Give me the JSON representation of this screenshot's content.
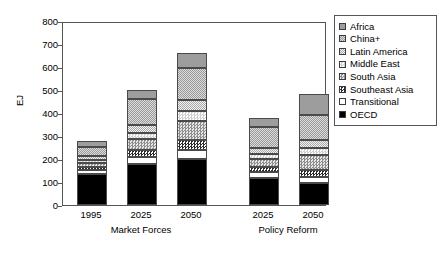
{
  "chart_data": {
    "type": "bar",
    "subtype": "stacked-bar",
    "title": "",
    "xlabel": "",
    "ylabel": "EJ",
    "ylim": [
      0,
      800
    ],
    "ytick_labels": [
      "800",
      "700",
      "600",
      "500",
      "400",
      "300",
      "200",
      "100",
      "0"
    ],
    "ytick_values": [
      800,
      700,
      600,
      500,
      400,
      300,
      200,
      100,
      0
    ],
    "grid": false,
    "legend_position": "right-outside",
    "categories": [
      "1995",
      "2025",
      "2050",
      "2025",
      "2050"
    ],
    "groups": [
      {
        "label": "Market Forces",
        "categories": [
          "1995",
          "2025",
          "2050"
        ]
      },
      {
        "label": "Policy Reform",
        "categories": [
          "2025",
          "2050"
        ]
      }
    ],
    "series": [
      {
        "name": "OECD",
        "pattern": "solid-black",
        "values": [
          133,
          178,
          202,
          117,
          97
        ]
      },
      {
        "name": "Transitional",
        "pattern": "white",
        "values": [
          19,
          32,
          37,
          25,
          24
        ]
      },
      {
        "name": "Southeast Asia",
        "pattern": "dark-checker",
        "values": [
          14,
          29,
          44,
          22,
          30
        ]
      },
      {
        "name": "South Asia",
        "pattern": "mid-checker",
        "values": [
          16,
          47,
          81,
          36,
          66
        ]
      },
      {
        "name": "Middle East",
        "pattern": "light-checker",
        "values": [
          14,
          29,
          43,
          22,
          30
        ]
      },
      {
        "name": "Latin America",
        "pattern": "light-stipple",
        "values": [
          15,
          31,
          48,
          26,
          37
        ]
      },
      {
        "name": "China+",
        "pattern": "mid-stipple",
        "values": [
          41,
          113,
          139,
          90,
          108
        ]
      },
      {
        "name": "Africa",
        "pattern": "solid-gray",
        "values": [
          28,
          43,
          66,
          39,
          92
        ]
      }
    ],
    "totals": [
      280,
      502,
      660,
      377,
      484
    ]
  },
  "legend": {
    "items": [
      {
        "label": "Africa"
      },
      {
        "label": "China+"
      },
      {
        "label": "Latin America"
      },
      {
        "label": "Middle East"
      },
      {
        "label": "South Asia"
      },
      {
        "label": "Southeast Asia"
      },
      {
        "label": "Transitional"
      },
      {
        "label": "OECD"
      }
    ]
  }
}
